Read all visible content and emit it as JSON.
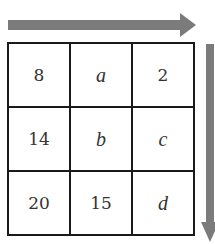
{
  "arrows": {
    "horizontal": {
      "direction": "right",
      "color": "#7b7b7b"
    },
    "vertical": {
      "direction": "down",
      "color": "#7b7b7b"
    }
  },
  "grid": {
    "rows": [
      [
        {
          "text": "8",
          "italic": false
        },
        {
          "text": "a",
          "italic": true
        },
        {
          "text": "2",
          "italic": false
        }
      ],
      [
        {
          "text": "14",
          "italic": false
        },
        {
          "text": "b",
          "italic": true
        },
        {
          "text": "c",
          "italic": true
        }
      ],
      [
        {
          "text": "20",
          "italic": false
        },
        {
          "text": "15",
          "italic": false
        },
        {
          "text": "d",
          "italic": true
        }
      ]
    ]
  }
}
